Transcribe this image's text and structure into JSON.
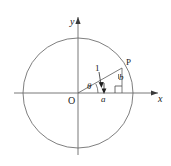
{
  "figure": {
    "type": "geometry-diagram",
    "background_color": "#ffffff",
    "stroke_color": "#555555",
    "text_color": "#1a1a1a"
  },
  "axes": {
    "x_label": "x",
    "y_label": "y",
    "origin_label": "O"
  },
  "circle": {
    "center_x": 78,
    "center_y": 93,
    "radius": 55
  },
  "point": {
    "label": "P",
    "x": 122,
    "y": 68
  },
  "labels": {
    "radius": "1",
    "angle": "θ",
    "horizontal_leg": "a",
    "vertical_leg": "b"
  }
}
